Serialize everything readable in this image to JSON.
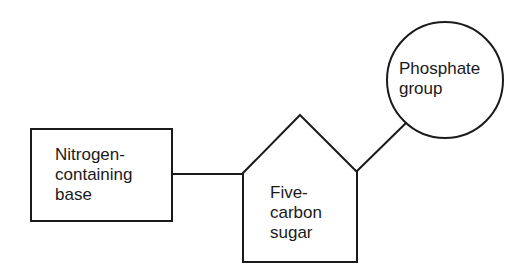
{
  "diagram": {
    "type": "nucleotide-structure",
    "nodes": {
      "base": {
        "label": "Nitrogen-\ncontaining\nbase",
        "shape": "rectangle"
      },
      "sugar": {
        "label": "Five-\ncarbon\nsugar",
        "shape": "pentagon"
      },
      "phosphate": {
        "label": "Phosphate\ngroup",
        "shape": "circle"
      }
    },
    "edges": [
      {
        "from": "base",
        "to": "sugar"
      },
      {
        "from": "sugar",
        "to": "phosphate"
      }
    ],
    "colors": {
      "stroke": "#1a1a1a",
      "background": "#ffffff"
    }
  }
}
